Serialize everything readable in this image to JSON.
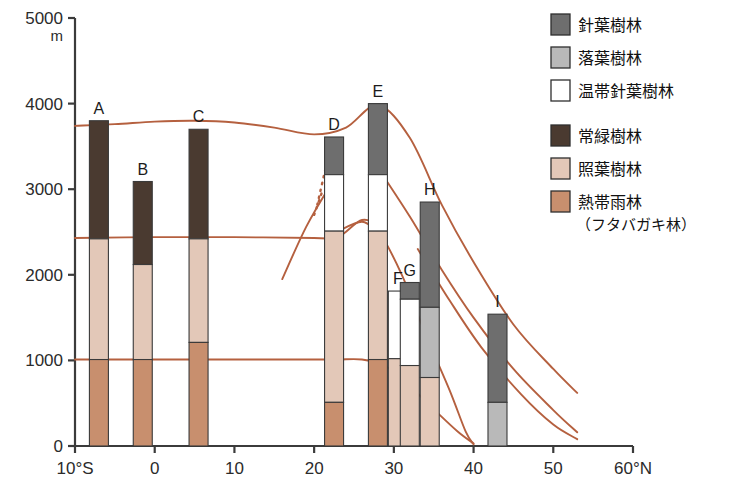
{
  "figure": {
    "y_axis": {
      "unit": "m",
      "ticks": [
        "5000",
        "4000",
        "3000",
        "2000",
        "1000",
        "0"
      ],
      "tick_values": [
        5000,
        4000,
        3000,
        2000,
        1000,
        0
      ],
      "range": [
        0,
        5000
      ]
    },
    "x_axis": {
      "ticks": [
        "10°S",
        "0",
        "10",
        "20",
        "30",
        "40",
        "50",
        "60°N"
      ],
      "tick_values": [
        -10,
        0,
        10,
        20,
        30,
        40,
        50,
        60
      ],
      "range": [
        -10,
        60
      ]
    }
  },
  "legend": {
    "items": [
      {
        "label": "針葉樹林",
        "color": "#6e6e6e",
        "key": "conifer"
      },
      {
        "label": "落葉樹林",
        "color": "#b9b9b9",
        "key": "deciduous"
      },
      {
        "label": "温帯針葉樹林",
        "color": "#ffffff",
        "key": "temperate-conifer"
      },
      {
        "label": "常緑樹林",
        "color": "#4a3a30",
        "key": "evergreen"
      },
      {
        "label": "照葉樹林",
        "color": "#e3c8b8",
        "key": "laurel"
      },
      {
        "label": "熱帯雨林",
        "color": "#c88f6e",
        "key": "tropical-rain",
        "sub_label": "（フタバガキ林）"
      }
    ]
  },
  "chart_data": {
    "type": "bar",
    "title": "",
    "xlabel": "",
    "ylabel": "m",
    "xlim": [
      -10,
      60
    ],
    "ylim": [
      0,
      5000
    ],
    "grid": false,
    "legend_position": "top-right",
    "stacked": true,
    "categories": [
      "A",
      "B",
      "C",
      "D",
      "E",
      "F",
      "G",
      "H",
      "I"
    ],
    "x": [
      -7.0,
      -1.5,
      5.5,
      22.5,
      28.0,
      30.5,
      32.0,
      34.5,
      43.0
    ],
    "bars": [
      {
        "label": "A",
        "latitude": -7.0,
        "top": 3800,
        "segments": [
          {
            "zone": "evergreen",
            "from": 2420,
            "to": 3800,
            "color": "#4a3a30"
          },
          {
            "zone": "laurel",
            "from": 1010,
            "to": 2420,
            "color": "#e3c8b8"
          },
          {
            "zone": "tropical-rain",
            "from": 0,
            "to": 1010,
            "color": "#c88f6e"
          }
        ]
      },
      {
        "label": "B",
        "latitude": -1.5,
        "top": 3090,
        "segments": [
          {
            "zone": "evergreen",
            "from": 2120,
            "to": 3090,
            "color": "#4a3a30"
          },
          {
            "zone": "laurel",
            "from": 1010,
            "to": 2120,
            "color": "#e3c8b8"
          },
          {
            "zone": "tropical-rain",
            "from": 0,
            "to": 1010,
            "color": "#c88f6e"
          }
        ]
      },
      {
        "label": "C",
        "latitude": 5.5,
        "top": 3700,
        "segments": [
          {
            "zone": "evergreen",
            "from": 2420,
            "to": 3700,
            "color": "#4a3a30"
          },
          {
            "zone": "laurel",
            "from": 1210,
            "to": 2420,
            "color": "#e3c8b8"
          },
          {
            "zone": "tropical-rain",
            "from": 0,
            "to": 1210,
            "color": "#c88f6e"
          }
        ]
      },
      {
        "label": "D",
        "latitude": 22.5,
        "top": 3610,
        "segments": [
          {
            "zone": "conifer",
            "from": 3170,
            "to": 3610,
            "color": "#6e6e6e"
          },
          {
            "zone": "temperate-conifer",
            "from": 2510,
            "to": 3170,
            "color": "#ffffff"
          },
          {
            "zone": "laurel",
            "from": 510,
            "to": 2510,
            "color": "#e3c8b8"
          },
          {
            "zone": "tropical-rain",
            "from": 0,
            "to": 510,
            "color": "#c88f6e"
          }
        ]
      },
      {
        "label": "E",
        "latitude": 28.0,
        "top": 4000,
        "segments": [
          {
            "zone": "conifer",
            "from": 3170,
            "to": 4000,
            "color": "#6e6e6e"
          },
          {
            "zone": "temperate-conifer",
            "from": 2510,
            "to": 3170,
            "color": "#ffffff"
          },
          {
            "zone": "laurel",
            "from": 1010,
            "to": 2510,
            "color": "#e3c8b8"
          },
          {
            "zone": "tropical-rain",
            "from": 0,
            "to": 1010,
            "color": "#c88f6e"
          }
        ]
      },
      {
        "label": "F",
        "latitude": 30.5,
        "top": 1810,
        "segments": [
          {
            "zone": "temperate-conifer",
            "from": 1020,
            "to": 1810,
            "color": "#ffffff"
          },
          {
            "zone": "laurel",
            "from": 0,
            "to": 1020,
            "color": "#e3c8b8"
          }
        ]
      },
      {
        "label": "G",
        "latitude": 32.0,
        "top": 1910,
        "segments": [
          {
            "zone": "conifer",
            "from": 1715,
            "to": 1910,
            "color": "#6e6e6e"
          },
          {
            "zone": "temperate-conifer",
            "from": 940,
            "to": 1715,
            "color": "#ffffff"
          },
          {
            "zone": "laurel",
            "from": 0,
            "to": 940,
            "color": "#e3c8b8"
          }
        ]
      },
      {
        "label": "H",
        "latitude": 34.5,
        "top": 2850,
        "segments": [
          {
            "zone": "conifer",
            "from": 1620,
            "to": 2850,
            "color": "#6e6e6e"
          },
          {
            "zone": "deciduous",
            "from": 800,
            "to": 1620,
            "color": "#b9b9b9"
          },
          {
            "zone": "laurel",
            "from": 0,
            "to": 800,
            "color": "#e3c8b8"
          }
        ]
      },
      {
        "label": "I",
        "latitude": 43.0,
        "top": 1540,
        "segments": [
          {
            "zone": "conifer",
            "from": 510,
            "to": 1540,
            "color": "#6e6e6e"
          },
          {
            "zone": "deciduous",
            "from": 0,
            "to": 510,
            "color": "#b9b9b9"
          }
        ]
      }
    ],
    "boundary_curves": [
      {
        "name": "upper-treeline",
        "color": "#b5603f",
        "points": [
          [
            -10,
            3740
          ],
          [
            -5,
            3760
          ],
          [
            0,
            3790
          ],
          [
            5,
            3800
          ],
          [
            10,
            3780
          ],
          [
            15,
            3720
          ],
          [
            20,
            3640
          ],
          [
            24,
            3720
          ],
          [
            28,
            3980
          ],
          [
            32,
            3600
          ],
          [
            36,
            2820
          ],
          [
            40,
            2150
          ],
          [
            45,
            1420
          ],
          [
            50,
            900
          ],
          [
            53,
            620
          ]
        ]
      },
      {
        "name": "mid-boundary",
        "color": "#b5603f",
        "points": [
          [
            -10,
            2430
          ],
          [
            0,
            2440
          ],
          [
            10,
            2440
          ],
          [
            20,
            2430
          ],
          [
            23,
            2440
          ],
          [
            26,
            2640
          ],
          [
            28,
            2520
          ],
          [
            31,
            2000
          ],
          [
            34,
            1300
          ],
          [
            37,
            650
          ],
          [
            39,
            170
          ],
          [
            40,
            20
          ]
        ]
      },
      {
        "name": "lower-boundary",
        "color": "#b5603f",
        "points": [
          [
            -10,
            1010
          ],
          [
            0,
            1010
          ],
          [
            10,
            1010
          ],
          [
            20,
            1010
          ],
          [
            23,
            1010
          ],
          [
            26,
            1010
          ],
          [
            29,
            930
          ],
          [
            32,
            700
          ],
          [
            35,
            430
          ],
          [
            38,
            170
          ],
          [
            40,
            30
          ]
        ]
      },
      {
        "name": "secondary-upper",
        "color": "#b5603f",
        "points": [
          [
            28,
            3250
          ],
          [
            32,
            2680
          ],
          [
            36,
            2060
          ],
          [
            40,
            1500
          ],
          [
            45,
            900
          ],
          [
            50,
            420
          ],
          [
            53,
            160
          ]
        ]
      },
      {
        "name": "secondary-mid",
        "color": "#b5603f",
        "points": [
          [
            33,
            2300
          ],
          [
            37,
            1700
          ],
          [
            41,
            1150
          ],
          [
            46,
            600
          ],
          [
            50,
            250
          ],
          [
            53,
            80
          ]
        ]
      },
      {
        "name": "d-ascending",
        "color": "#b5603f",
        "points": [
          [
            16,
            1950
          ],
          [
            19,
            2560
          ],
          [
            22,
            3040
          ],
          [
            23,
            3160
          ]
        ]
      },
      {
        "name": "d-descending",
        "color": "#b5603f",
        "points": [
          [
            23,
            2510
          ],
          [
            26,
            2620
          ],
          [
            28,
            2500
          ]
        ]
      }
    ],
    "dashed_segments": [
      {
        "name": "d-dotted-projection",
        "color": "#b5603f",
        "points": [
          [
            20.4,
            2820
          ],
          [
            22.2,
            3560
          ]
        ]
      },
      {
        "name": "d-dotted-projection-2",
        "color": "#b5603f",
        "points": [
          [
            20.0,
            2700
          ],
          [
            21.0,
            2970
          ]
        ]
      }
    ]
  }
}
